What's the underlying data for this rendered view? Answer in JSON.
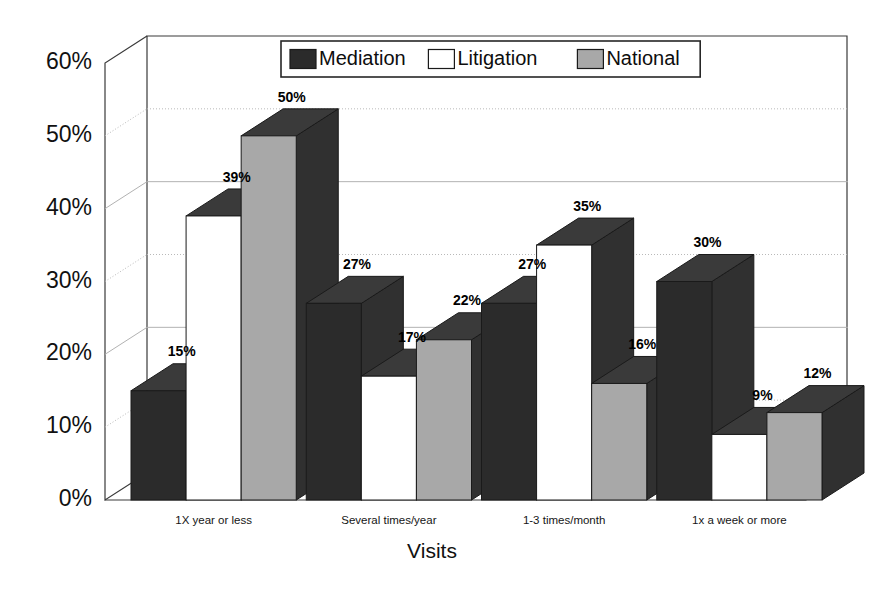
{
  "chart_data": {
    "type": "bar",
    "title": "",
    "subtitle": "",
    "xlabel": "Visits",
    "ylabel": "",
    "categories": [
      "1X year or less",
      "Several times/year",
      "1-3 times/month",
      "1x a week or more"
    ],
    "series": [
      {
        "name": "Mediation",
        "values": [
          15,
          27,
          27,
          30
        ],
        "color": "#2b2b2b",
        "swatch": "dark"
      },
      {
        "name": "Litigation",
        "values": [
          39,
          17,
          35,
          9
        ],
        "color": "#ffffff",
        "swatch": "white"
      },
      {
        "name": "National",
        "values": [
          50,
          22,
          16,
          12
        ],
        "color": "#a8a8a8",
        "swatch": "gray"
      }
    ],
    "value_labels": [
      [
        "15%",
        "39%",
        "50%"
      ],
      [
        "27%",
        "17%",
        "22%"
      ],
      [
        "27%",
        "35%",
        "16%"
      ],
      [
        "30%",
        "9%",
        "12%"
      ]
    ],
    "ylim": [
      0,
      60
    ],
    "ytick_step": 10,
    "ytick_labels": [
      "0%",
      "10%",
      "20%",
      "30%",
      "40%",
      "50%",
      "60%"
    ],
    "ytick_values": [
      0,
      10,
      20,
      30,
      40,
      50,
      60
    ],
    "grid": true,
    "grid_style_by_tick": [
      "none",
      "dotted",
      "solid",
      "dotted",
      "solid",
      "dotted",
      "none"
    ],
    "legend": {
      "position": "top-center",
      "entries": [
        "Mediation",
        "Litigation",
        "National"
      ]
    },
    "projection": "3d",
    "colors": {
      "mediation": "#2b2b2b",
      "litigation": "#ffffff",
      "national": "#a8a8a8",
      "outline": "#1a1a1a",
      "frame": "#3a3a3a",
      "grid": "#b9b9b9",
      "text": "#111111",
      "background": "#ffffff"
    }
  }
}
